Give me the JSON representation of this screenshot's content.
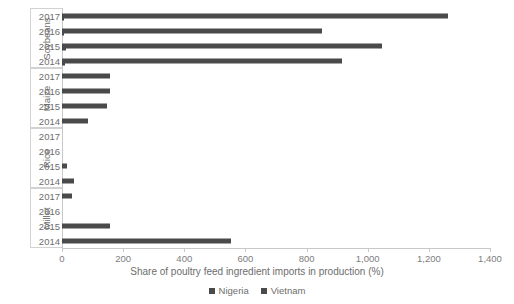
{
  "chart_data": {
    "type": "bar",
    "orientation": "horizontal",
    "title": "",
    "xlabel": "Share of poultry feed ingredient imports in production (%)",
    "ylabel": "",
    "xlim": [
      0,
      1400
    ],
    "xticks": [
      "0",
      "200",
      "400",
      "600",
      "800",
      "1,000",
      "1,200",
      "1,400"
    ],
    "xtick_values": [
      0,
      200,
      400,
      600,
      800,
      1000,
      1200,
      1400
    ],
    "grid": false,
    "legend_position": "bottom",
    "series": [
      {
        "name": "Nigeria",
        "color": "#4a4a4a"
      },
      {
        "name": "Vietnam",
        "color": "#4a4a4a"
      }
    ],
    "groups": [
      {
        "label": "Soybeans",
        "rows": [
          {
            "year": "2017",
            "series": "Vietnam",
            "value": 1263
          },
          {
            "year": "2016",
            "series": "Vietnam",
            "value": 850
          },
          {
            "year": "2015",
            "series": "Vietnam",
            "value": 1047
          },
          {
            "year": "2014",
            "series": "Vietnam",
            "value": 916
          }
        ],
        "nigeria_rows": [
          {
            "year": "2017",
            "series": "Nigeria",
            "value": 6
          },
          {
            "year": "2016",
            "series": "Nigeria",
            "value": 8
          },
          {
            "year": "2015",
            "series": "Nigeria",
            "value": 14
          },
          {
            "year": "2014",
            "series": "Nigeria",
            "value": 10
          }
        ]
      },
      {
        "label": "Maize",
        "rows": [
          {
            "year": "2017",
            "series": "Vietnam",
            "value": 157
          },
          {
            "year": "2016",
            "series": "Vietnam",
            "value": 157
          },
          {
            "year": "2015",
            "series": "Vietnam",
            "value": 147
          },
          {
            "year": "2014",
            "series": "Vietnam",
            "value": 85
          }
        ],
        "nigeria_rows": []
      },
      {
        "label": "Rice",
        "rows": [
          {
            "year": "2017",
            "series": "Vietnam",
            "value": 0
          },
          {
            "year": "2016",
            "series": "Vietnam",
            "value": 0
          },
          {
            "year": "2015",
            "series": "Vietnam",
            "value": 16
          },
          {
            "year": "2014",
            "series": "Vietnam",
            "value": 39
          }
        ],
        "nigeria_rows": []
      },
      {
        "label": "Millet",
        "rows": [
          {
            "year": "2017",
            "series": "Vietnam",
            "value": 33
          },
          {
            "year": "2016",
            "series": "Vietnam",
            "value": 0
          },
          {
            "year": "2015",
            "series": "Vietnam",
            "value": 157
          },
          {
            "year": "2014",
            "series": "Vietnam",
            "value": 553
          }
        ],
        "nigeria_rows": []
      }
    ]
  },
  "legend": {
    "items": [
      {
        "label": "Nigeria",
        "color": "#4a4a4a"
      },
      {
        "label": "Vietnam",
        "color": "#4a4a4a"
      }
    ]
  },
  "axis": {
    "x_title": "Share of poultry feed ingredient imports in production (%)"
  }
}
